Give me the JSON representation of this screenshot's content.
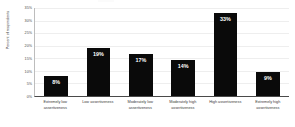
{
  "chart_data": {
    "type": "bar",
    "title": "",
    "xlabel": "",
    "ylabel": "Percent of respondents",
    "ylim": [
      0,
      35
    ],
    "grid": true,
    "legend": false,
    "orientation": "vertical",
    "bar_color": "#0a0a0a",
    "value_label_color": "#ffffff",
    "categories": [
      "Extremely low assertiveness",
      "Low assertiveness",
      "Moderately low assertiveness",
      "Moderately high assertiveness",
      "High assertiveness",
      "Extremely high assertiveness"
    ],
    "category_lines": [
      [
        "Extremely low",
        "assertiveness"
      ],
      [
        "Low assertiveness",
        ""
      ],
      [
        "Moderately low",
        "assertiveness"
      ],
      [
        "Moderately high",
        "assertiveness"
      ],
      [
        "High assertiveness",
        ""
      ],
      [
        "Extremely high",
        "assertiveness"
      ]
    ],
    "values": [
      7.8,
      19.0,
      16.7,
      14.3,
      33.0,
      9.4
    ],
    "value_labels": [
      "8%",
      "19%",
      "17%",
      "14%",
      "33%",
      "9%"
    ],
    "yticks": [
      0,
      5,
      10,
      15,
      20,
      25,
      30,
      35
    ],
    "ytick_labels": [
      "0%",
      "5%",
      "10%",
      "15%",
      "20%",
      "25%",
      "30%",
      "35%"
    ]
  }
}
